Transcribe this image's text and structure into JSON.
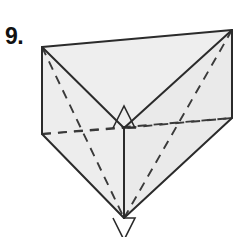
{
  "figure": {
    "item_number": "9.",
    "shape_name": "triangular-prism",
    "colors": {
      "background": "#ffffff",
      "face_fill": "#eeeeee",
      "edge_stroke": "#2b2b2b",
      "hidden_edge_stroke": "#3a3a3a",
      "number_text": "#111111"
    },
    "stroke_widths": {
      "visible_edge": 2.0,
      "hidden_edge": 1.9,
      "right_angle_marker": 1.6
    },
    "dash_pattern": "9 7",
    "vertices": {
      "top_back_left": [
        42,
        47
      ],
      "top_back_right": [
        232,
        30
      ],
      "top_front": [
        124,
        128
      ],
      "bottom_back_left": [
        42,
        134
      ],
      "bottom_back_right": [
        232,
        118
      ],
      "bottom_front": [
        124,
        218
      ]
    },
    "visible_edges": [
      {
        "name": "top-back-edge",
        "from": "top_back_left",
        "to": "top_back_right"
      },
      {
        "name": "top-left-edge",
        "from": "top_back_left",
        "to": "top_front"
      },
      {
        "name": "top-right-edge",
        "from": "top_back_right",
        "to": "top_front"
      },
      {
        "name": "left-vertical-edge",
        "from": "top_back_left",
        "to": "bottom_back_left"
      },
      {
        "name": "right-vertical-edge",
        "from": "top_back_right",
        "to": "bottom_back_right"
      },
      {
        "name": "front-vertical-edge",
        "from": "top_front",
        "to": "bottom_front"
      },
      {
        "name": "bottom-left-edge",
        "from": "bottom_back_left",
        "to": "bottom_front"
      },
      {
        "name": "bottom-right-edge",
        "from": "bottom_back_right",
        "to": "bottom_front"
      }
    ],
    "hidden_edges": [
      {
        "name": "hidden-back-bottom-edge",
        "from": "bottom_back_left",
        "to": "bottom_back_right"
      },
      {
        "name": "hidden-upper-left-diagonal",
        "from": "top_back_left",
        "to": "bottom_front"
      },
      {
        "name": "hidden-upper-right-diagonal",
        "from": "top_back_right",
        "to": "bottom_front"
      },
      {
        "name": "hidden-lower-left-diagonal",
        "from": "bottom_back_left",
        "to": "top_front"
      },
      {
        "name": "hidden-lower-right-diagonal",
        "from": "bottom_back_right",
        "to": "top_front"
      }
    ],
    "right_angle_markers": [
      {
        "name": "top-front-right-angle",
        "center": [
          124,
          128
        ],
        "size": 22
      },
      {
        "name": "bottom-front-right-angle",
        "center": [
          124,
          218
        ],
        "size": 22
      }
    ]
  }
}
